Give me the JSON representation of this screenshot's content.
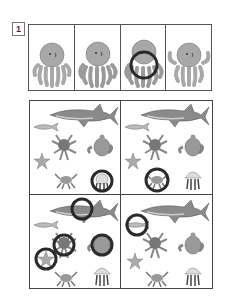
{
  "worksheet": {
    "item_number": "1",
    "reference_strip": {
      "cells": [
        {
          "subject": "octopus",
          "variant": "arms-curled",
          "circled": false
        },
        {
          "subject": "octopus",
          "variant": "arms-layered",
          "circled": false
        },
        {
          "subject": "octopus",
          "variant": "arms-layered",
          "circled": true
        },
        {
          "subject": "octopus",
          "variant": "arms-raised",
          "circled": false
        }
      ]
    },
    "scene_grid": {
      "panels": [
        {
          "position": "top-left",
          "creatures": [
            "shark",
            "fish",
            "octopus",
            "turtle",
            "starfish",
            "crab",
            "hermit-crab"
          ],
          "circled": [
            "hermit-crab"
          ]
        },
        {
          "position": "top-right",
          "creatures": [
            "shark",
            "fish",
            "octopus",
            "turtle",
            "starfish",
            "crab",
            "jellyfish"
          ],
          "circled": [
            "crab"
          ]
        },
        {
          "position": "bottom-left",
          "creatures": [
            "shark",
            "fish",
            "octopus",
            "turtle",
            "starfish",
            "crab",
            "jellyfish"
          ],
          "circled": [
            "shark",
            "octopus",
            "turtle",
            "starfish"
          ]
        },
        {
          "position": "bottom-right",
          "creatures": [
            "shark",
            "fish",
            "octopus",
            "turtle",
            "starfish",
            "crab",
            "jellyfish"
          ],
          "circled": [
            "fish"
          ]
        }
      ]
    },
    "colors": {
      "creature_fill": "#a8a8a8",
      "creature_dark": "#6e6e6e",
      "outline": "#555555",
      "ring": "#2a2a2a",
      "background": "#ffffff"
    }
  }
}
